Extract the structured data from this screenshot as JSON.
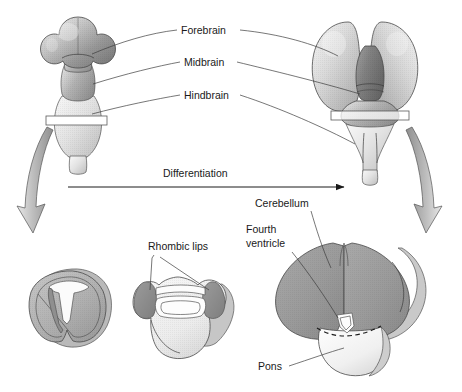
{
  "figure": {
    "title": "Brain differentiation",
    "background_color": "#ffffff",
    "width": 462,
    "height": 392
  },
  "labels": {
    "forebrain": "Forebrain",
    "midbrain": "Midbrain",
    "hindbrain": "Hindbrain",
    "differentiation": "Differentiation",
    "rhombic_lips": "Rhombic lips",
    "cerebellum": "Cerebellum",
    "fourth_ventricle_line1": "Fourth",
    "fourth_ventricle_line2": "ventricle",
    "pons": "Pons"
  },
  "colors": {
    "text": "#1a1a1a",
    "leader_line": "#3c3c3c",
    "outline": "#4a4a4a",
    "forebrain_dark": "#8e8e8e",
    "forebrain_light": "#d8d8d8",
    "midbrain_gray": "#a3a3a3",
    "hindbrain_light": "#e3e3e3",
    "cerebellum_gray": "#9a9a9a",
    "pons_white": "#f2f2f2",
    "rhombic_lip_dark": "#8a8a8a",
    "arrow_gray": "#b5b5b5",
    "section_plane": "#ffffff"
  },
  "structures": {
    "embryonic_brain": {
      "name": "Embryonic brain vesicles",
      "parts": [
        "forebrain",
        "midbrain",
        "hindbrain",
        "spinal cord"
      ]
    },
    "adult_brain": {
      "name": "Differentiated brain",
      "parts": [
        "cerebral hemispheres",
        "midbrain",
        "pons",
        "cerebellum",
        "medulla"
      ]
    },
    "cross_sections": [
      {
        "name": "early-hindbrain-section",
        "features": [
          "neural canal",
          "alar plate",
          "basal plate"
        ]
      },
      {
        "name": "rhombic-lip-section",
        "features": [
          "rhombic lips",
          "fourth ventricle",
          "roof plate"
        ]
      },
      {
        "name": "mature-cerebellum-section",
        "features": [
          "cerebellum",
          "fourth ventricle",
          "pons"
        ]
      }
    ]
  }
}
